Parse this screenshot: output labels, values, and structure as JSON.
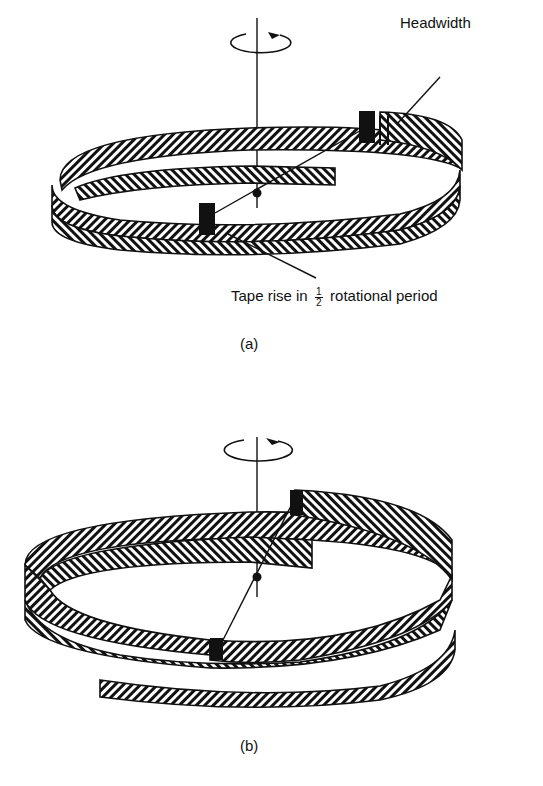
{
  "figure_a": {
    "caption": "(a)",
    "label_headwidth": "Headwidth",
    "label_tape_rise_prefix": "Tape rise in",
    "label_tape_rise_num": "1",
    "label_tape_rise_den": "2",
    "label_tape_rise_suffix": "rotational period"
  },
  "figure_b": {
    "caption": "(b)"
  },
  "icons": {
    "rotation": "rotation-arrow-icon"
  }
}
